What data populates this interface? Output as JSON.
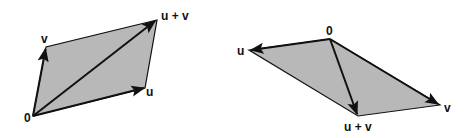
{
  "diagram": {
    "type": "vector-addition-parallelogram",
    "colors": {
      "fill": "#b8b8b8",
      "stroke": "#111111",
      "background": "#ffffff"
    },
    "figures": [
      {
        "name": "left",
        "points": {
          "origin": [
            33,
            116
          ],
          "u": [
            145,
            88
          ],
          "v": [
            46,
            47
          ],
          "sum": [
            157,
            20
          ]
        },
        "labels": {
          "origin": "0",
          "u": "u",
          "v": "v",
          "sum": "u + v"
        }
      },
      {
        "name": "right",
        "points": {
          "origin": [
            330,
            39
          ],
          "u": [
            249,
            50
          ],
          "v": [
            440,
            105
          ],
          "sum": [
            358,
            116
          ]
        },
        "labels": {
          "origin": "0",
          "u": "u",
          "v": "v",
          "sum": "u + v"
        }
      }
    ]
  }
}
